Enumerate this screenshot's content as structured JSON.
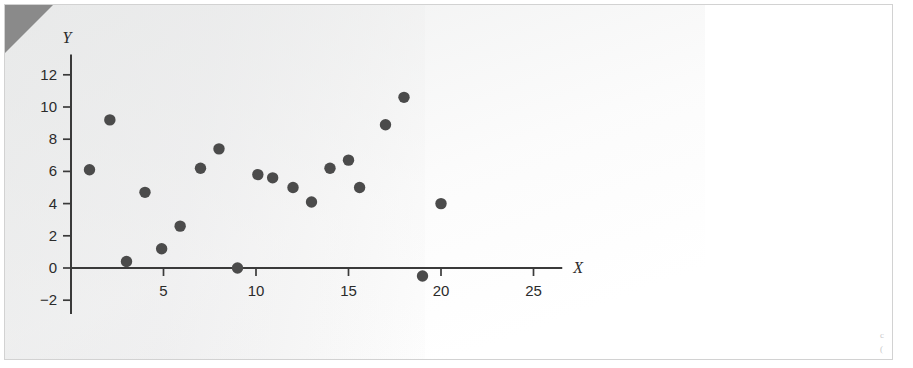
{
  "figure": {
    "background_color": "#ffffff",
    "paper_tint_color": "#eceded",
    "frame_color": "#d2d2d2",
    "dogear_color": "#8a8a8a",
    "point_color": "#4b4b4b",
    "axis_color": "#3a3a3a"
  },
  "margin_notes": {
    "note_a": "c",
    "note_b": "("
  },
  "chart_data": {
    "type": "scatter",
    "title": "",
    "xlabel": "X",
    "ylabel": "Y",
    "xlim": [
      0,
      26.5
    ],
    "ylim": [
      -2.8,
      13.2
    ],
    "xticks": [
      5,
      10,
      15,
      20,
      25
    ],
    "yticks": [
      -2,
      0,
      2,
      4,
      6,
      8,
      10,
      12
    ],
    "xtick_labels": [
      "5",
      "10",
      "15",
      "20",
      "25"
    ],
    "ytick_labels": [
      "−2",
      "0",
      "2",
      "4",
      "6",
      "8",
      "10",
      "12"
    ],
    "grid": false,
    "legend": false,
    "marker": "circle",
    "marker_size": 7,
    "series": [
      {
        "name": "observations",
        "points": [
          {
            "x": 1.0,
            "y": 6.1
          },
          {
            "x": 2.1,
            "y": 9.2
          },
          {
            "x": 3.0,
            "y": 0.4
          },
          {
            "x": 4.0,
            "y": 4.7
          },
          {
            "x": 4.9,
            "y": 1.2
          },
          {
            "x": 5.9,
            "y": 2.6
          },
          {
            "x": 7.0,
            "y": 6.2
          },
          {
            "x": 8.0,
            "y": 7.4
          },
          {
            "x": 9.0,
            "y": 0.0
          },
          {
            "x": 10.1,
            "y": 5.8
          },
          {
            "x": 10.9,
            "y": 5.6
          },
          {
            "x": 12.0,
            "y": 5.0
          },
          {
            "x": 13.0,
            "y": 4.1
          },
          {
            "x": 14.0,
            "y": 6.2
          },
          {
            "x": 15.0,
            "y": 6.7
          },
          {
            "x": 15.6,
            "y": 5.0
          },
          {
            "x": 17.0,
            "y": 8.9
          },
          {
            "x": 18.0,
            "y": 10.6
          },
          {
            "x": 19.0,
            "y": -0.5
          },
          {
            "x": 20.0,
            "y": 4.0
          }
        ]
      }
    ]
  }
}
